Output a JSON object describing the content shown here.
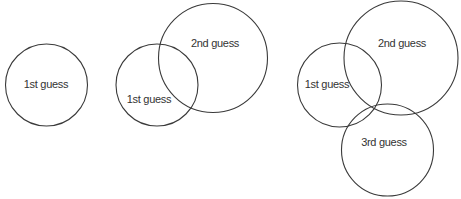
{
  "diagram": {
    "stroke_color": "#3a3a3a",
    "text_color": "#333333",
    "panels": [
      {
        "name": "step-1",
        "circles": [
          {
            "id": "guess-1",
            "label": "1st guess",
            "cx": 46.5,
            "cy": 85,
            "r": 41,
            "label_x": 46,
            "label_y": 85
          }
        ]
      },
      {
        "name": "step-2",
        "circles": [
          {
            "id": "guess-1",
            "label": "1st guess",
            "cx": 157,
            "cy": 85,
            "r": 41,
            "label_x": 149,
            "label_y": 100
          },
          {
            "id": "guess-2",
            "label": "2nd guess",
            "cx": 213,
            "cy": 58,
            "r": 54.5,
            "label_x": 215,
            "label_y": 44
          }
        ]
      },
      {
        "name": "step-3",
        "circles": [
          {
            "id": "guess-1",
            "label": "1st guess",
            "cx": 339.5,
            "cy": 85,
            "r": 42,
            "label_x": 327,
            "label_y": 85
          },
          {
            "id": "guess-2",
            "label": "2nd guess",
            "cx": 401,
            "cy": 58,
            "r": 57,
            "label_x": 402,
            "label_y": 44
          },
          {
            "id": "guess-3",
            "label": "3rd guess",
            "cx": 387.5,
            "cy": 150,
            "r": 46,
            "label_x": 384,
            "label_y": 143
          }
        ]
      }
    ]
  }
}
